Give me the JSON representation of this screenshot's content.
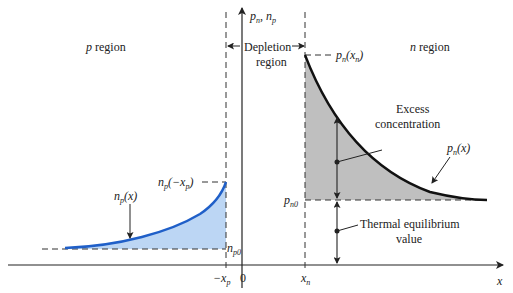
{
  "diagram": {
    "axes": {
      "y_label_main": "p",
      "y_label_sub": "n",
      "y_label_sep": ", ",
      "y_label_main2": "n",
      "y_label_sub2": "p",
      "x_label": "x",
      "origin_label": "0",
      "neg_xp_label": "−x",
      "neg_xp_sub": "p",
      "xn_label": "x",
      "xn_sub": "n"
    },
    "regions": {
      "p_region": "p",
      "p_region_suffix": " region",
      "n_region": "n",
      "n_region_suffix": " region",
      "depletion_line1": "Depletion",
      "depletion_line2": "region"
    },
    "labels": {
      "pn_xn": "p",
      "pn_xn_sub": "n",
      "pn_xn_arg": "(x",
      "pn_xn_arg_sub": "n",
      "pn_xn_close": ")",
      "pn_x": "p",
      "pn_x_sub": "n",
      "pn_x_arg": "(x)",
      "pn0": "p",
      "pn0_sub": "n0",
      "np_neg_xp": "n",
      "np_neg_xp_sub": "p",
      "np_neg_xp_arg": "(−x",
      "np_neg_xp_arg_sub": "p",
      "np_neg_xp_close": ")",
      "np_x": "n",
      "np_x_sub": "p",
      "np_x_arg": "(x)",
      "np0": "n",
      "np0_sub": "p0",
      "excess_line1": "Excess",
      "excess_line2": "concentration",
      "thermal_line1": "Thermal equilibrium",
      "thermal_line2": "value"
    },
    "colors": {
      "n_side_fill": "#b4b4b4",
      "n_side_curve": "#111111",
      "p_side_fill": "#bcd6f4",
      "p_side_curve": "#1f5fc8",
      "axis": "#222222"
    }
  }
}
